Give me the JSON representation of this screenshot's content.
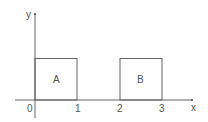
{
  "diagram": {
    "axes": {
      "x_label": "x",
      "y_label": "y",
      "origin_label": "0",
      "x_ticks": [
        {
          "label": "1",
          "value": 1
        },
        {
          "label": "2",
          "value": 2
        },
        {
          "label": "3",
          "value": 3
        }
      ]
    },
    "regions": [
      {
        "label": "A",
        "x_from": 0,
        "x_to": 1
      },
      {
        "label": "B",
        "x_from": 2,
        "x_to": 3
      }
    ],
    "colors": {
      "line": "#555555",
      "background": "#ffffff"
    }
  }
}
